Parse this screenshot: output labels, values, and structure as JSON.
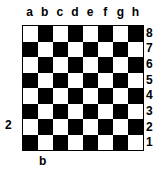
{
  "board": {
    "files": [
      "a",
      "b",
      "c",
      "d",
      "e",
      "f",
      "g",
      "h"
    ],
    "ranks": [
      "8",
      "7",
      "6",
      "5",
      "4",
      "3",
      "2",
      "1"
    ],
    "light_color": "#ffffff",
    "dark_color": "#000000",
    "top_left_square": "light"
  },
  "annotations": {
    "side_label": "2",
    "bottom_label": "b"
  }
}
